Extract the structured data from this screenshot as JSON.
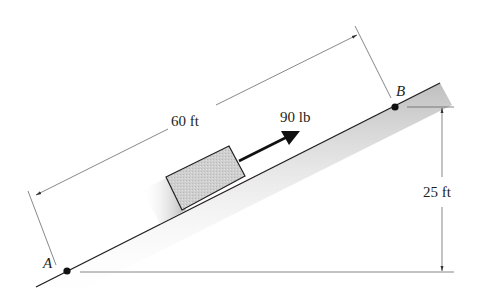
{
  "diagram": {
    "labels": {
      "point_a": "A",
      "point_b": "B",
      "incline_length": "60 ft",
      "force": "90 lb",
      "height": "25 ft"
    },
    "colors": {
      "line": "#231f20",
      "block_fill": "#c9c9c9",
      "shadow": "#bdbdbd",
      "dim_line": "#555555"
    }
  }
}
